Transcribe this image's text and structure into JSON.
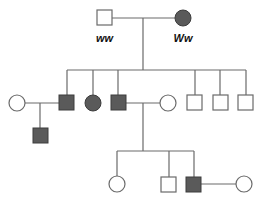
{
  "diagram": {
    "type": "pedigree",
    "colors": {
      "line": "#6a6a6a",
      "affected_fill": "#5a5a5a",
      "affected_stroke": "#3c3c3c",
      "unaffected_fill": "#ffffff",
      "unaffected_stroke": "#6a6a6a"
    },
    "generation_1": {
      "father": {
        "sex": "male",
        "affected": false,
        "genotype": "ww"
      },
      "mother": {
        "sex": "female",
        "affected": true,
        "genotype": "Ww"
      }
    },
    "generation_2": [
      {
        "id": "II-spouse-1",
        "sex": "female",
        "affected": false,
        "role": "spouse"
      },
      {
        "id": "II-1",
        "sex": "male",
        "affected": true
      },
      {
        "id": "II-2",
        "sex": "female",
        "affected": true
      },
      {
        "id": "II-3",
        "sex": "male",
        "affected": true
      },
      {
        "id": "II-spouse-2",
        "sex": "female",
        "affected": false,
        "role": "spouse"
      },
      {
        "id": "II-4",
        "sex": "male",
        "affected": false
      },
      {
        "id": "II-5",
        "sex": "male",
        "affected": false
      },
      {
        "id": "II-6",
        "sex": "male",
        "affected": false
      }
    ],
    "generation_3": [
      {
        "id": "III-1",
        "sex": "male",
        "affected": true,
        "parents": [
          "II-spouse-1",
          "II-1"
        ]
      },
      {
        "id": "III-2",
        "sex": "female",
        "affected": false,
        "parents": [
          "II-3",
          "II-spouse-2"
        ]
      },
      {
        "id": "III-3",
        "sex": "male",
        "affected": false,
        "parents": [
          "II-3",
          "II-spouse-2"
        ]
      },
      {
        "id": "III-4",
        "sex": "male",
        "affected": true,
        "parents": [
          "II-3",
          "II-spouse-2"
        ]
      },
      {
        "id": "III-spouse",
        "sex": "female",
        "affected": false,
        "role": "spouse"
      }
    ]
  }
}
